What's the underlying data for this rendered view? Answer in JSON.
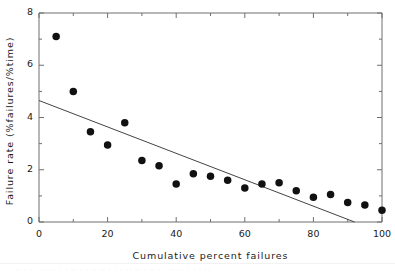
{
  "chart_data": {
    "type": "scatter",
    "title": "",
    "xlabel": "Cumulative  percent  failures",
    "ylabel": "Failure  rate   (%failures/%time)",
    "xlim": [
      0,
      100
    ],
    "ylim": [
      0,
      8
    ],
    "xticks": [
      0,
      20,
      40,
      60,
      80,
      100
    ],
    "yticks": [
      0,
      2,
      4,
      6,
      8
    ],
    "xtick_labels": [
      "0",
      "20",
      "40",
      "60",
      "80",
      "100"
    ],
    "ytick_labels": [
      "0",
      "2",
      "4",
      "6",
      "8"
    ],
    "xminor_ticks": [
      10,
      30,
      50,
      70,
      90
    ],
    "yminor_ticks": [
      1,
      3,
      5,
      7
    ],
    "grid": false,
    "legend": null,
    "marker": {
      "shape": "circle",
      "color": "#111111",
      "size_px": 7.5
    },
    "points": [
      {
        "x": 5,
        "y": 7.1
      },
      {
        "x": 10,
        "y": 5.0
      },
      {
        "x": 15,
        "y": 3.45
      },
      {
        "x": 20,
        "y": 2.95
      },
      {
        "x": 25,
        "y": 3.8
      },
      {
        "x": 30,
        "y": 2.35
      },
      {
        "x": 35,
        "y": 2.15
      },
      {
        "x": 40,
        "y": 1.45
      },
      {
        "x": 45,
        "y": 1.85
      },
      {
        "x": 50,
        "y": 1.75
      },
      {
        "x": 55,
        "y": 1.6
      },
      {
        "x": 60,
        "y": 1.3
      },
      {
        "x": 65,
        "y": 1.45
      },
      {
        "x": 70,
        "y": 1.5
      },
      {
        "x": 75,
        "y": 1.2
      },
      {
        "x": 80,
        "y": 0.95
      },
      {
        "x": 85,
        "y": 1.05
      },
      {
        "x": 90,
        "y": 0.75
      },
      {
        "x": 95,
        "y": 0.65
      },
      {
        "x": 100,
        "y": 0.45
      }
    ],
    "trend_line": {
      "type": "line",
      "style": "solid",
      "color": "#444444",
      "x_start": 0,
      "y_start": 4.65,
      "x_end": 92,
      "y_end": 0.0
    },
    "axis_color": "#6e6e6e",
    "background": "#ffffff"
  },
  "scan_artifact": {
    "text": "· ·· ·  · ·   ··  ·· ·  ·   ·· ·   ·  ··   ·· · ·  ·   ·· ·· ·   ·· ·   ·  ·· ·· ·   · ·  ··"
  }
}
